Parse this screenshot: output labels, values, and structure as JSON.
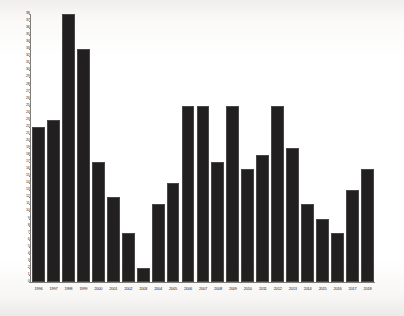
{
  "chart_data": {
    "type": "bar",
    "title": "",
    "subtitle": "",
    "xlabel": "",
    "ylabel": "",
    "grid": false,
    "legend": null,
    "ylim": [
      0,
      38
    ],
    "ytick_step": 1,
    "bar_color": "#211f1f",
    "background_color": "#ffffff",
    "axis_color": "#7d7c7a",
    "categories": [
      "1996",
      "1997",
      "1998",
      "1999",
      "2000",
      "2001",
      "2002",
      "2003",
      "2004",
      "2005",
      "2006",
      "2007",
      "2008",
      "2009",
      "2010",
      "2011",
      "2012",
      "2013",
      "2014",
      "2015",
      "2016",
      "2017",
      "2018"
    ],
    "values": [
      22,
      23,
      38,
      33,
      17,
      12,
      7,
      2,
      11,
      14,
      25,
      25,
      17,
      25,
      16,
      18,
      25,
      19,
      11,
      9,
      7,
      13,
      16
    ],
    "yticks": [
      "38",
      "37",
      "36",
      "35",
      "34",
      "33",
      "32",
      "31",
      "30",
      "29",
      "28",
      "27",
      "26",
      "25",
      "24",
      "23",
      "22",
      "21",
      "20",
      "19",
      "18",
      "17",
      "16",
      "15",
      "14",
      "13",
      "12",
      "11",
      "10",
      "9",
      "8",
      "7",
      "6",
      "5",
      "4",
      "3",
      "2",
      "1",
      "0"
    ]
  }
}
